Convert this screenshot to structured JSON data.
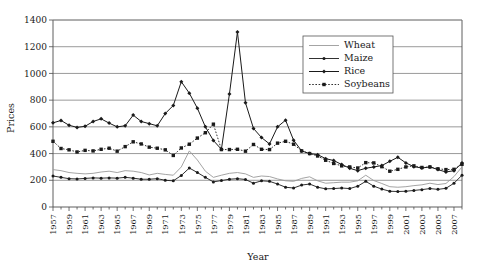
{
  "chart_data": {
    "type": "line",
    "title": "",
    "xlabel": "Year",
    "ylabel": "Prices",
    "ylim": [
      0,
      1400
    ],
    "ytick_step": 200,
    "yticks": [
      0,
      200,
      400,
      600,
      800,
      1000,
      1200,
      1400
    ],
    "xlim": [
      1957,
      2008
    ],
    "xtick_labels": [
      "1957",
      "1959",
      "1961",
      "1963",
      "1965",
      "1967",
      "1969",
      "1971",
      "1973",
      "1975",
      "1977",
      "1979",
      "1981",
      "1983",
      "1985",
      "1987",
      "1989",
      "1991",
      "1993",
      "1995",
      "1997",
      "1999",
      "2001",
      "2003",
      "2005",
      "2007"
    ],
    "xtick_step": 2,
    "minor_xticks_every_year": true,
    "grid": "horizontal",
    "legend_position": "top-right-inside",
    "x": [
      1957,
      1958,
      1959,
      1960,
      1961,
      1962,
      1963,
      1964,
      1965,
      1966,
      1967,
      1968,
      1969,
      1970,
      1971,
      1972,
      1973,
      1974,
      1975,
      1976,
      1977,
      1978,
      1979,
      1980,
      1981,
      1982,
      1983,
      1984,
      1985,
      1986,
      1987,
      1988,
      1989,
      1990,
      1991,
      1992,
      1993,
      1994,
      1995,
      1996,
      1997,
      1998,
      1999,
      2000,
      2001,
      2002,
      2003,
      2004,
      2005,
      2006,
      2007,
      2008
    ],
    "series": [
      {
        "name": "Wheat",
        "color": "#9a9a9a",
        "marker": "none",
        "line": "solid",
        "width": 0.9,
        "values": [
          280,
          272,
          258,
          252,
          248,
          252,
          262,
          268,
          258,
          272,
          268,
          258,
          240,
          252,
          244,
          238,
          300,
          420,
          352,
          268,
          222,
          238,
          252,
          258,
          248,
          222,
          232,
          228,
          210,
          196,
          192,
          214,
          226,
          196,
          178,
          182,
          186,
          186,
          196,
          238,
          198,
          176,
          152,
          148,
          152,
          160,
          166,
          178,
          168,
          176,
          228,
          300
        ]
      },
      {
        "name": "Maize",
        "color": "#1a1a1a",
        "marker": "dot",
        "line": "solid",
        "width": 0.9,
        "values": [
          232,
          222,
          212,
          210,
          214,
          218,
          216,
          218,
          216,
          222,
          216,
          208,
          208,
          212,
          200,
          196,
          236,
          292,
          258,
          222,
          188,
          198,
          208,
          212,
          206,
          178,
          196,
          192,
          172,
          148,
          142,
          164,
          172,
          148,
          136,
          138,
          142,
          138,
          156,
          192,
          156,
          134,
          118,
          116,
          118,
          124,
          130,
          138,
          132,
          140,
          178,
          238
        ]
      },
      {
        "name": "Rice",
        "color": "#1a1a1a",
        "marker": "diamond",
        "line": "solid",
        "width": 1.0,
        "values": [
          630,
          648,
          612,
          596,
          604,
          640,
          660,
          628,
          600,
          608,
          688,
          640,
          624,
          608,
          700,
          760,
          938,
          852,
          740,
          600,
          498,
          432,
          846,
          1310,
          780,
          588,
          520,
          472,
          600,
          650,
          500,
          420,
          400,
          392,
          362,
          348,
          318,
          290,
          272,
          290,
          300,
          310,
          342,
          372,
          330,
          302,
          292,
          300,
          280,
          262,
          272,
          330
        ]
      },
      {
        "name": "Soybeans",
        "color": "#1a1a1a",
        "marker": "square",
        "line": "dotted",
        "width": 0.9,
        "values": [
          492,
          438,
          428,
          412,
          424,
          420,
          432,
          440,
          418,
          452,
          488,
          472,
          448,
          440,
          428,
          386,
          442,
          470,
          516,
          556,
          620,
          430,
          430,
          432,
          418,
          468,
          432,
          430,
          478,
          492,
          470,
          420,
          400,
          382,
          350,
          326,
          308,
          300,
          292,
          332,
          330,
          302,
          268,
          282,
          300,
          308,
          296,
          300,
          286,
          280,
          282,
          320
        ]
      }
    ]
  },
  "legend": {
    "entries": [
      {
        "label": "Wheat"
      },
      {
        "label": "Maize"
      },
      {
        "label": "Rice"
      },
      {
        "label": "Soybeans"
      }
    ]
  },
  "axes": {
    "y_title": "Prices",
    "x_title": "Year"
  }
}
